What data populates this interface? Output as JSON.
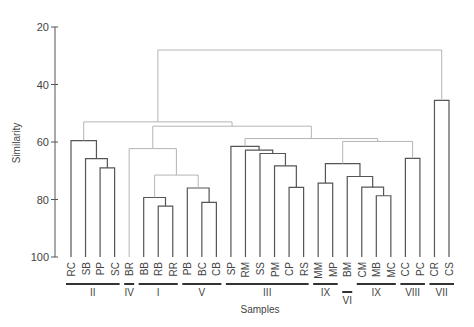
{
  "chart_data": {
    "type": "dendrogram",
    "title": "",
    "xlabel": "Samples",
    "ylabel": "Similarity",
    "ylim": [
      20,
      100
    ],
    "y_ticks": [
      20,
      40,
      60,
      80,
      100
    ],
    "grid": false,
    "leaves": [
      "RC",
      "SB",
      "PP",
      "SC",
      "BR",
      "BB",
      "RB",
      "RR",
      "PB",
      "BC",
      "CB",
      "SP",
      "RM",
      "SS",
      "PM",
      "CP",
      "RS",
      "MM",
      "MP",
      "BM",
      "CM",
      "MB",
      "MC",
      "CC",
      "PC",
      "CR",
      "CS"
    ],
    "groups": [
      {
        "label": "II",
        "from": 0,
        "to": 3,
        "style": "solid"
      },
      {
        "label": "IV",
        "from": 4,
        "to": 4,
        "style": "solid"
      },
      {
        "label": "I",
        "from": 5,
        "to": 7,
        "style": "solid"
      },
      {
        "label": "V",
        "from": 8,
        "to": 10,
        "style": "solid"
      },
      {
        "label": "III",
        "from": 11,
        "to": 16,
        "style": "solid"
      },
      {
        "label": "IX",
        "from": 17,
        "to": 18,
        "style": "solid"
      },
      {
        "label": "VI",
        "from": 19,
        "to": 19,
        "style": "solid",
        "offset": true
      },
      {
        "label": "IX",
        "from": 20,
        "to": 22,
        "style": "solid"
      },
      {
        "label": "VIII",
        "from": 23,
        "to": 24,
        "style": "solid"
      },
      {
        "label": "VII",
        "from": 25,
        "to": 26,
        "style": "solid"
      }
    ],
    "merges": [
      {
        "id": "n_pp_sc",
        "left": 2,
        "right": 3,
        "sim": 69.0,
        "shade": "dark"
      },
      {
        "id": "n_sb",
        "left": 1,
        "right": "n_pp_sc",
        "sim": 65.8,
        "shade": "dark"
      },
      {
        "id": "n_II",
        "left": 0,
        "right": "n_sb",
        "sim": 59.5,
        "shade": "dark"
      },
      {
        "id": "n_rb_rr",
        "left": 6,
        "right": 7,
        "sim": 82.3,
        "shade": "dark"
      },
      {
        "id": "n_I",
        "left": 5,
        "right": "n_rb_rr",
        "sim": 79.3,
        "shade": "dark"
      },
      {
        "id": "n_bc_cb",
        "left": 9,
        "right": 10,
        "sim": 81.0,
        "shade": "dark"
      },
      {
        "id": "n_V",
        "left": 8,
        "right": "n_bc_cb",
        "sim": 76.0,
        "shade": "dark"
      },
      {
        "id": "n_I_V",
        "left": "n_I",
        "right": "n_V",
        "sim": 71.5,
        "shade": "light"
      },
      {
        "id": "n_IV_IV",
        "left": 4,
        "right": "n_I_V",
        "sim": 62.3,
        "shade": "light"
      },
      {
        "id": "n_cp_rs",
        "left": 15,
        "right": 16,
        "sim": 75.8,
        "shade": "dark"
      },
      {
        "id": "n_pm",
        "left": 14,
        "right": "n_cp_rs",
        "sim": 68.3,
        "shade": "dark"
      },
      {
        "id": "n_ss",
        "left": 13,
        "right": "n_pm",
        "sim": 64.0,
        "shade": "dark"
      },
      {
        "id": "n_rm",
        "left": 12,
        "right": "n_ss",
        "sim": 62.8,
        "shade": "dark"
      },
      {
        "id": "n_III",
        "left": 11,
        "right": "n_rm",
        "sim": 61.5,
        "shade": "dark"
      },
      {
        "id": "n_mm_mp",
        "left": 17,
        "right": 18,
        "sim": 74.3,
        "shade": "dark"
      },
      {
        "id": "n_mb_mc",
        "left": 21,
        "right": 22,
        "sim": 78.7,
        "shade": "dark"
      },
      {
        "id": "n_cm",
        "left": 20,
        "right": "n_mb_mc",
        "sim": 75.7,
        "shade": "dark"
      },
      {
        "id": "n_bm",
        "left": 19,
        "right": "n_cm",
        "sim": 72.0,
        "shade": "dark"
      },
      {
        "id": "n_IX_VI",
        "left": "n_mm_mp",
        "right": "n_bm",
        "sim": 67.5,
        "shade": "dark"
      },
      {
        "id": "n_VIII",
        "left": 23,
        "right": 24,
        "sim": 65.7,
        "shade": "dark"
      },
      {
        "id": "n_IX_VIII",
        "left": "n_IX_VI",
        "right": "n_VIII",
        "sim": 59.8,
        "shade": "light"
      },
      {
        "id": "n_III_IX",
        "left": "n_III",
        "right": "n_IX_VIII",
        "sim": 58.8,
        "shade": "light"
      },
      {
        "id": "n_mid",
        "left": "n_IV_IV",
        "right": "n_III_IX",
        "sim": 54.5,
        "shade": "light"
      },
      {
        "id": "n_main",
        "left": "n_II",
        "right": "n_mid",
        "sim": 53.0,
        "shade": "light"
      },
      {
        "id": "n_VII",
        "left": 25,
        "right": 26,
        "sim": 45.5,
        "shade": "dark"
      },
      {
        "id": "n_root",
        "left": "n_main",
        "right": "n_VII",
        "sim": 28.0,
        "shade": "light"
      }
    ]
  },
  "colors": {
    "dark": "#555555",
    "light": "#b4b4b4",
    "axis": "#555555",
    "text": "#444444"
  }
}
